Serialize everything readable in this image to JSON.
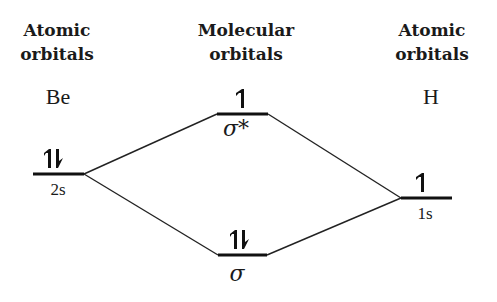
{
  "headers": {
    "left": [
      "Atomic",
      "orbitals"
    ],
    "center": [
      "Molecular",
      "orbitals"
    ],
    "right": [
      "Atomic",
      "orbitals"
    ]
  },
  "atoms": {
    "left": "Be",
    "right": "H"
  },
  "levels": {
    "be_2s": {
      "label": "2s",
      "electrons": "up-down"
    },
    "sigma_star": {
      "label": "σ*",
      "electrons": "up"
    },
    "sigma": {
      "label": "σ",
      "electrons": "up-down"
    },
    "h_1s": {
      "label": "1s",
      "electrons": "up"
    }
  },
  "colors": {
    "ink": "#111111",
    "background": "#ffffff"
  }
}
